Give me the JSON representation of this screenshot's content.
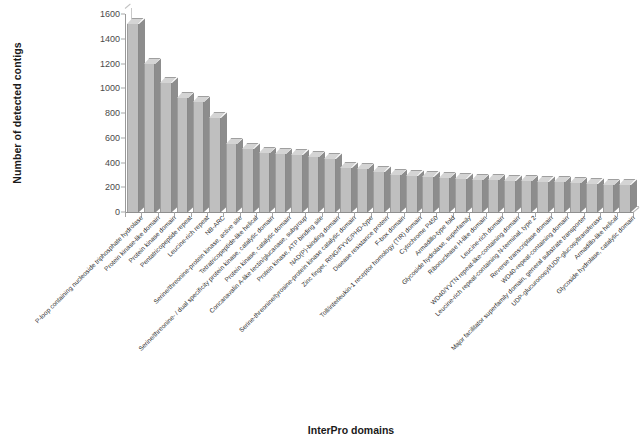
{
  "chart_data": {
    "type": "bar",
    "title": "",
    "xlabel": "InterPro domains",
    "ylabel": "Number of detected contigs",
    "ylim": [
      0,
      1600
    ],
    "yticks": [
      0,
      200,
      400,
      600,
      800,
      1000,
      1200,
      1400,
      1600
    ],
    "grid": false,
    "legend": null,
    "bar_color": "#bfbfbf",
    "categories": [
      "P-loop containing nucleoside triphosphate hydrolase",
      "Protein kinase-like domain",
      "Protein kinase domain",
      "Pentatricopeptide repeat",
      "Leucine-rich repeat",
      "NB-ARC",
      "Serine/threonine-protein kinase, active site",
      "Tetratricopeptide-like helical",
      "Serine/threonine- / dual specificity protein kinase, catalytic domain",
      "Protein kinase, catalytic domain",
      "Concanavalin A-like lectin/glucanase, subgroup",
      "Protein kinase, ATP binding site",
      "NAD(P)-binding domain",
      "Serine-threonine/tyrosine-protein kinase catalytic domain",
      "Zinc finger, RING/FYVE/PHD-type",
      "Disease resistance protein",
      "F-box domain",
      "Toll/interleukin-1 receptor homology (TIR) domain",
      "Cytochrome P450",
      "Armadillo-type fold",
      "Glycoside hydrolase, superfamily",
      "Ribonuclease H-like domain",
      "Leucine-rich domain",
      "WD40/YVTN repeat-like-containing domain",
      "Leucine-rich repeat-containing N-terminal, type 2",
      "Reverse transcriptase domain",
      "WD40-repeat-containing domain",
      "Major facilitator superfamily domain, general substrate transporter",
      "UDP-glucuronosyl/UDP-glucosyltransferase",
      "Armadillo-like helical",
      "Glycoside hydrolase, catalytic domain"
    ],
    "values": [
      1520,
      1200,
      1045,
      925,
      890,
      760,
      550,
      510,
      475,
      465,
      458,
      442,
      425,
      355,
      345,
      320,
      300,
      288,
      282,
      272,
      268,
      262,
      258,
      252,
      248,
      245,
      240,
      232,
      228,
      222,
      215
    ]
  }
}
